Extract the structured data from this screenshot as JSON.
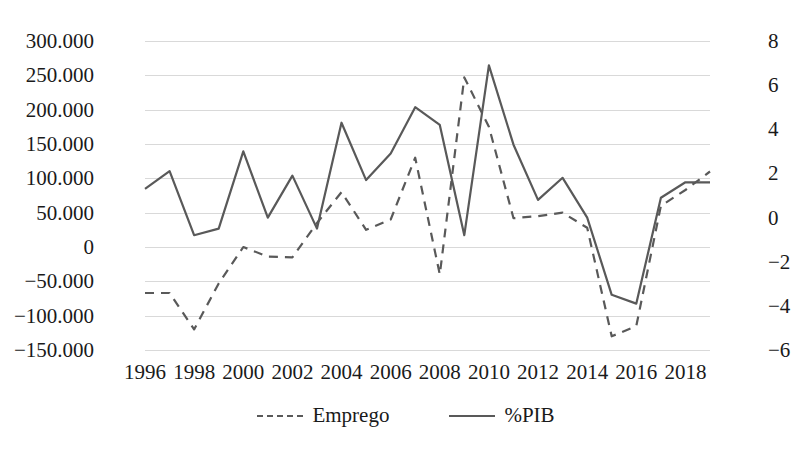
{
  "chart_data": {
    "type": "line",
    "title": "",
    "xlabel": "",
    "ylabel": "",
    "grid": true,
    "legend_position": "bottom",
    "x": [
      1996,
      1997,
      1998,
      1999,
      2000,
      2001,
      2002,
      2003,
      2004,
      2005,
      2006,
      2007,
      2008,
      2009,
      2010,
      2011,
      2012,
      2013,
      2014,
      2015,
      2016,
      2017,
      2018,
      2019
    ],
    "x_tick_labels": [
      "1996",
      "1998",
      "2000",
      "2002",
      "2004",
      "2006",
      "2008",
      "2010",
      "2012",
      "2014",
      "2016",
      "2018"
    ],
    "x_tick_values": [
      1996,
      1998,
      2000,
      2002,
      2004,
      2006,
      2008,
      2010,
      2012,
      2014,
      2016,
      2018
    ],
    "left_axis": {
      "name": "Emprego",
      "tick_labels": [
        "300.000",
        "250.000",
        "200.000",
        "150.000",
        "100.000",
        "50.000",
        "0",
        "−50.000",
        "−100.000",
        "−150.000"
      ],
      "tick_values": [
        300000,
        250000,
        200000,
        150000,
        100000,
        50000,
        0,
        -50000,
        -100000,
        -150000
      ],
      "ylim": [
        -150000,
        300000
      ]
    },
    "right_axis": {
      "name": "%PIB",
      "tick_labels": [
        "8",
        "6",
        "4",
        "2",
        "0",
        "−2",
        "−4",
        "−6"
      ],
      "tick_values": [
        8,
        6,
        4,
        2,
        0,
        -2,
        -4,
        -6
      ],
      "ylim": [
        -6,
        8
      ]
    },
    "series": [
      {
        "name": "Emprego",
        "axis": "left",
        "style": "dashed",
        "color": "#595959",
        "values": [
          -67000,
          -67000,
          -120000,
          -53000,
          0,
          -14000,
          -15000,
          35000,
          80000,
          25000,
          40000,
          130000,
          -40000,
          247000,
          175000,
          42000,
          45000,
          50000,
          28000,
          -130000,
          -115000,
          60000,
          83000,
          110000
        ]
      },
      {
        "name": "%PIB",
        "axis": "right",
        "style": "solid",
        "color": "#595959",
        "values": [
          1.3,
          2.1,
          -0.8,
          -0.5,
          3.0,
          0.0,
          1.9,
          -0.5,
          4.3,
          1.7,
          2.9,
          5.0,
          4.2,
          -0.8,
          6.9,
          3.3,
          0.8,
          1.8,
          0.0,
          -3.5,
          -3.9,
          0.9,
          1.6,
          1.6
        ]
      }
    ]
  },
  "legend": {
    "items": [
      {
        "label": "Emprego",
        "style": "dashed"
      },
      {
        "label": "%PIB",
        "style": "solid"
      }
    ]
  },
  "colors": {
    "line": "#595959",
    "grid": "#d9d9d9",
    "text": "#1a1a1a",
    "background": "#ffffff"
  }
}
